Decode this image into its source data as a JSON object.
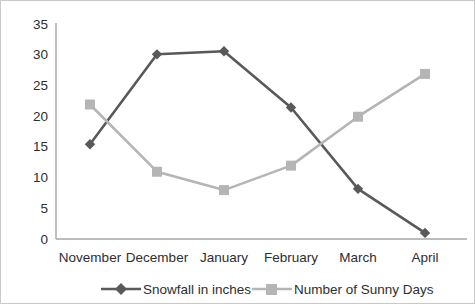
{
  "chart_data": {
    "type": "line",
    "title": "",
    "xlabel": "",
    "ylabel": "",
    "categories": [
      "November",
      "December",
      "January",
      "February",
      "March",
      "April"
    ],
    "series": [
      {
        "name": "Snowfall in inches",
        "color": "#595959",
        "marker": "diamond",
        "values": [
          15.5,
          30.2,
          30.7,
          21.5,
          8.2,
          1.0
        ]
      },
      {
        "name": "Number of Sunny Days",
        "color": "#b5b5b5",
        "marker": "square",
        "values": [
          22,
          11,
          8,
          12,
          20,
          27
        ]
      }
    ],
    "ylim": [
      0,
      35
    ],
    "yticks": [
      0,
      5,
      10,
      15,
      20,
      25,
      30,
      35
    ],
    "ytick_labels": [
      "0",
      "5",
      "10",
      "15",
      "20",
      "25",
      "30",
      "35"
    ],
    "grid": false,
    "legend_position": "bottom"
  },
  "axes": {
    "y_tick_labels": [
      "35",
      "30",
      "25",
      "20",
      "15",
      "10",
      "5",
      "0"
    ],
    "x_tick_labels": [
      "November",
      "December",
      "January",
      "February",
      "March",
      "April"
    ],
    "axis_color": "#a6a6a6"
  },
  "legend": {
    "items": [
      {
        "label": "Snowfall in inches",
        "color": "#595959",
        "marker": "diamond"
      },
      {
        "label": "Number of Sunny Days",
        "color": "#b5b5b5",
        "marker": "square"
      }
    ]
  }
}
